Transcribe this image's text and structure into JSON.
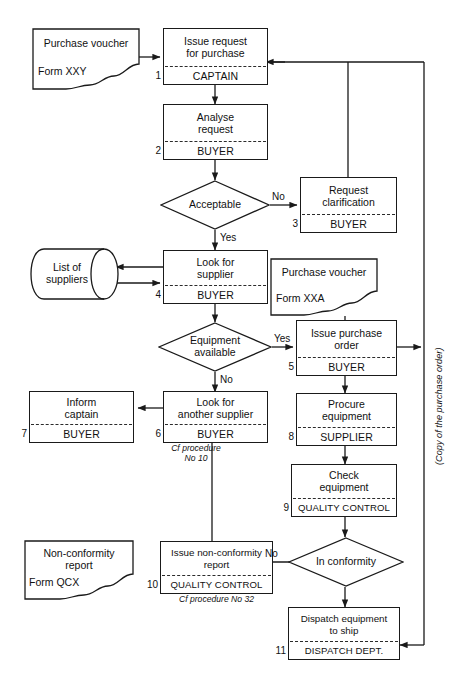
{
  "diagram": {
    "line_color": "#1a1a1a",
    "background": "#ffffff"
  },
  "documents": [
    {
      "id": "doc-purchase-voucher-xxy",
      "title": "Purchase voucher",
      "form": "Form XXY"
    },
    {
      "id": "doc-purchase-voucher-xxa",
      "title": "Purchase voucher",
      "form": "Form XXA"
    },
    {
      "id": "doc-non-conformity-report",
      "title": "Non-conformity report",
      "title_line1": "Non-conformity",
      "title_line2": "report",
      "form": "Form QCX"
    }
  ],
  "datastores": [
    {
      "id": "store-list-of-suppliers",
      "label_line1": "List of",
      "label_line2": "suppliers"
    }
  ],
  "steps": [
    {
      "number": "1",
      "action_line1": "Issue request",
      "action_line2": "for purchase",
      "actor": "CAPTAIN",
      "note": ""
    },
    {
      "number": "2",
      "action_line1": "Analyse",
      "action_line2": "request",
      "actor": "BUYER",
      "note": ""
    },
    {
      "number": "3",
      "action_line1": "Request",
      "action_line2": "clarification",
      "actor": "BUYER",
      "note": ""
    },
    {
      "number": "4",
      "action_line1": "Look for",
      "action_line2": "supplier",
      "actor": "BUYER",
      "note": ""
    },
    {
      "number": "5",
      "action_line1": "Issue purchase",
      "action_line2": "order",
      "actor": "BUYER",
      "note": ""
    },
    {
      "number": "6",
      "action_line1": "Look for",
      "action_line2": "another supplier",
      "actor": "BUYER",
      "note": "Cf procedure\nNo 10"
    },
    {
      "number": "7",
      "action_line1": "Inform",
      "action_line2": "captain",
      "actor": "BUYER",
      "note": ""
    },
    {
      "number": "8",
      "action_line1": "Procure",
      "action_line2": "equipment",
      "actor": "SUPPLIER",
      "note": ""
    },
    {
      "number": "9",
      "action_line1": "Check",
      "action_line2": "equipment",
      "actor": "QUALITY CONTROL",
      "note": ""
    },
    {
      "number": "10",
      "action_line1": "Issue non-conformity",
      "action_line2": "report",
      "actor": "QUALITY CONTROL",
      "note": "Cf procedure No 32"
    },
    {
      "number": "11",
      "action_line1": "Dispatch equipment",
      "action_line2": "to ship",
      "actor": "DISPATCH DEPT.",
      "note": ""
    }
  ],
  "decisions": [
    {
      "id": "decision-acceptable",
      "label": "Acceptable",
      "yes": "Yes",
      "no": "No"
    },
    {
      "id": "decision-equipment-available",
      "label_line1": "Equipment",
      "label_line2": "available",
      "yes": "Yes",
      "no": "No"
    },
    {
      "id": "decision-in-conformity",
      "label": "In conformity",
      "yes": "",
      "no": "No"
    }
  ],
  "edge_labels": {
    "acceptable_no": "No",
    "acceptable_yes": "Yes",
    "equipment_yes": "Yes",
    "equipment_no": "No",
    "conformity_no": "No",
    "copy_of_purchase_order": "(Copy of the purchase order)"
  }
}
